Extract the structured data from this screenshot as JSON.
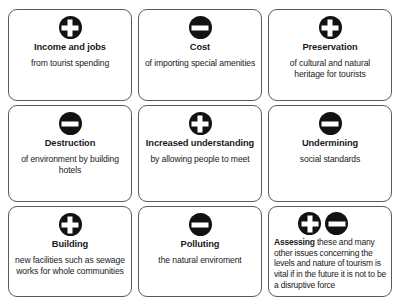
{
  "diagram": {
    "icon_names": {
      "positive": "plus-circle-icon",
      "negative": "minus-circle-icon"
    },
    "cards": [
      {
        "icons": [
          "plus"
        ],
        "title": "Income and jobs",
        "body": "from tourist spending"
      },
      {
        "icons": [
          "minus"
        ],
        "title": "Cost",
        "body": "of importing special amenities"
      },
      {
        "icons": [
          "plus"
        ],
        "title": "Preservation",
        "body": "of cultural and natural heritage for tourists"
      },
      {
        "icons": [
          "minus"
        ],
        "title": "Destruction",
        "body": "of environment by building hotels"
      },
      {
        "icons": [
          "plus"
        ],
        "title": "Increased understanding",
        "body": "by allowing people to meet"
      },
      {
        "icons": [
          "minus"
        ],
        "title": "Undermining",
        "body": "social standards"
      },
      {
        "icons": [
          "plus"
        ],
        "title": "Building",
        "body": "new facilities such as sewage works for whole communities"
      },
      {
        "icons": [
          "minus"
        ],
        "title": "Polluting",
        "body": "the natural enviroment"
      },
      {
        "icons": [
          "plus",
          "minus"
        ],
        "lead": "Assessing",
        "rest": " these and many other issues concerning the levels and nature of tourism is vital if in the future it is not to be a disruptive force"
      }
    ]
  }
}
